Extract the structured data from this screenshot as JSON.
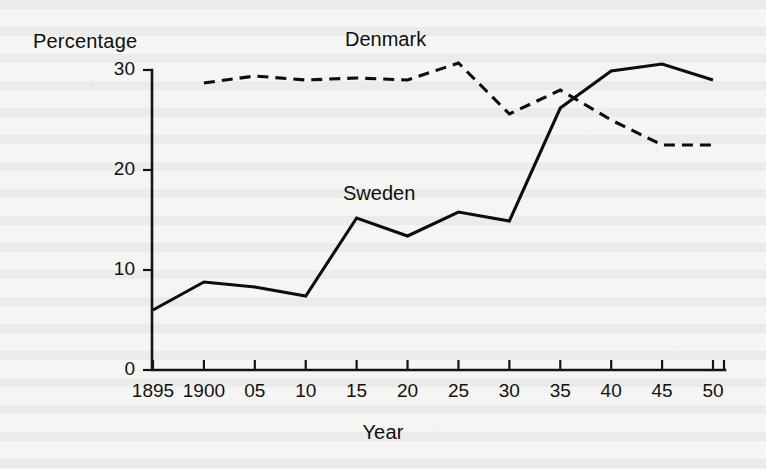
{
  "page": {
    "background_color": "#f5f5f3",
    "ink_color": "#0f0f0f",
    "media": "scanned-book-page"
  },
  "chart_data": {
    "type": "line",
    "title": "",
    "subtitle": "",
    "xlabel": "Year",
    "ylabel": "Percentage",
    "xlim": [
      1895,
      1950
    ],
    "ylim": [
      0,
      30
    ],
    "grid": false,
    "legend": "inline-annotations",
    "x": [
      1895,
      1900,
      1905,
      1910,
      1915,
      1920,
      1925,
      1930,
      1935,
      1940,
      1945,
      1950
    ],
    "categories": [
      "1895",
      "1900",
      "05",
      "10",
      "15",
      "20",
      "25",
      "30",
      "35",
      "40",
      "45",
      "50"
    ],
    "xtick_labels": [
      "1895",
      "1900",
      "05",
      "10",
      "15",
      "20",
      "25",
      "30",
      "35",
      "40",
      "45",
      "50"
    ],
    "ytick_labels": [
      "0",
      "10",
      "20",
      "30"
    ],
    "yticks": [
      0,
      10,
      20,
      30
    ],
    "series": [
      {
        "name": "Denmark",
        "style": "dashed",
        "color": "#0d0d0d",
        "x": [
          1900,
          1905,
          1910,
          1915,
          1920,
          1925,
          1930,
          1935,
          1940,
          1945,
          1950
        ],
        "values": [
          28.7,
          29.4,
          29.0,
          29.2,
          29.0,
          30.7,
          25.6,
          28.0,
          25.0,
          22.5,
          22.5
        ]
      },
      {
        "name": "Sweden",
        "style": "solid",
        "color": "#0d0d0d",
        "x": [
          1895,
          1900,
          1905,
          1910,
          1915,
          1920,
          1925,
          1930,
          1935,
          1940,
          1945,
          1950
        ],
        "values": [
          6.0,
          8.8,
          8.3,
          7.4,
          15.2,
          13.4,
          15.8,
          14.9,
          26.2,
          29.9,
          30.6,
          29.0
        ]
      }
    ],
    "annotations": [
      {
        "text": "Denmark",
        "series": "Denmark"
      },
      {
        "text": "Sweden",
        "series": "Sweden"
      }
    ]
  },
  "axes": {
    "y_axis_title": "Percentage",
    "x_axis_title": "Year"
  }
}
